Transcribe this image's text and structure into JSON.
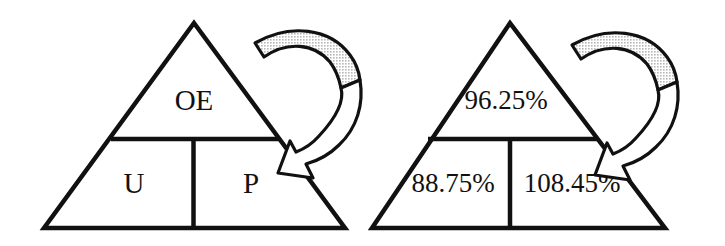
{
  "figure": {
    "type": "pyramid-diagram-pair",
    "background_color": "#ffffff",
    "line_color": "#111111",
    "arrow_fill_gray": "#d8d8d8",
    "arrow_fill_white": "#ffffff"
  },
  "left_pyramid": {
    "name": "abbreviation-pyramid",
    "top_cell": {
      "label": "OE"
    },
    "bottom_left_cell": {
      "label": "U"
    },
    "bottom_right_cell": {
      "label": "P"
    }
  },
  "right_pyramid": {
    "name": "percentage-pyramid",
    "top_cell": {
      "label": "96.25%"
    },
    "bottom_left_cell": {
      "label": "88.75%"
    },
    "bottom_right_cell": {
      "label": "108.45%"
    }
  },
  "arrows": [
    {
      "name": "curved-arrow-left",
      "direction": "clockwise-down-left",
      "style": "hooked-curve"
    },
    {
      "name": "curved-arrow-right",
      "direction": "clockwise-down-left",
      "style": "hooked-curve"
    }
  ]
}
